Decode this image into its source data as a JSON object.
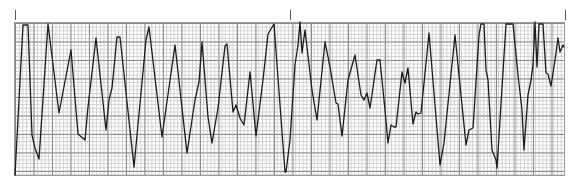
{
  "strip": {
    "grid": {
      "minor_color": "#cfcfcf",
      "major_color": "#8a8a8a",
      "background": "#ffffff",
      "minor_px": 3.7,
      "major_px": 18.5
    },
    "trace_color": "#1a1a1a",
    "markers": [
      {
        "x": 15
      },
      {
        "x": 290
      },
      {
        "x": 565
      }
    ]
  },
  "chart_data": {
    "type": "line",
    "title": "",
    "xlabel": "",
    "ylabel": "",
    "grid": true,
    "legend": "none",
    "note": "ECG rhythm strip on grid paper; coordinates are pixel positions (x right, y down)",
    "points": [
      [
        15,
        175
      ],
      [
        23,
        25
      ],
      [
        28,
        25
      ],
      [
        32,
        135
      ],
      [
        35,
        148
      ],
      [
        39,
        159
      ],
      [
        48,
        24
      ],
      [
        59,
        113
      ],
      [
        71,
        50
      ],
      [
        78,
        134
      ],
      [
        85,
        140
      ],
      [
        88,
        107
      ],
      [
        96,
        38
      ],
      [
        106,
        130
      ],
      [
        109,
        100
      ],
      [
        112,
        88
      ],
      [
        117,
        37
      ],
      [
        120,
        37
      ],
      [
        134,
        167
      ],
      [
        146,
        40
      ],
      [
        149,
        27
      ],
      [
        162,
        137
      ],
      [
        175,
        45
      ],
      [
        187,
        153
      ],
      [
        195,
        100
      ],
      [
        199,
        82
      ],
      [
        202,
        42
      ],
      [
        208,
        117
      ],
      [
        212,
        143
      ],
      [
        218,
        108
      ],
      [
        225,
        46
      ],
      [
        227,
        44
      ],
      [
        233,
        112
      ],
      [
        236,
        105
      ],
      [
        240,
        118
      ],
      [
        244,
        125
      ],
      [
        250,
        72
      ],
      [
        256,
        136
      ],
      [
        263,
        80
      ],
      [
        268,
        34
      ],
      [
        274,
        24
      ],
      [
        285,
        172
      ],
      [
        286,
        172
      ],
      [
        290,
        140
      ],
      [
        295,
        65
      ],
      [
        298,
        45
      ],
      [
        300,
        22
      ],
      [
        302,
        53
      ],
      [
        305,
        30
      ],
      [
        312,
        90
      ],
      [
        317,
        120
      ],
      [
        325,
        42
      ],
      [
        330,
        67
      ],
      [
        336,
        103
      ],
      [
        338,
        104
      ],
      [
        342,
        136
      ],
      [
        348,
        80
      ],
      [
        355,
        55
      ],
      [
        361,
        95
      ],
      [
        364,
        100
      ],
      [
        367,
        93
      ],
      [
        370,
        108
      ],
      [
        377,
        60
      ],
      [
        380,
        60
      ],
      [
        385,
        110
      ],
      [
        388,
        143
      ],
      [
        391,
        125
      ],
      [
        394,
        127
      ],
      [
        396,
        127
      ],
      [
        402,
        72
      ],
      [
        405,
        83
      ],
      [
        408,
        68
      ],
      [
        413,
        124
      ],
      [
        416,
        112
      ],
      [
        418,
        114
      ],
      [
        421,
        113
      ],
      [
        429,
        33
      ],
      [
        440,
        165
      ],
      [
        444,
        143
      ],
      [
        455,
        35
      ],
      [
        466,
        145
      ],
      [
        469,
        130
      ],
      [
        473,
        128
      ],
      [
        479,
        35
      ],
      [
        481,
        24
      ],
      [
        484,
        24
      ],
      [
        486,
        70
      ],
      [
        488,
        80
      ],
      [
        492,
        150
      ],
      [
        496,
        160
      ],
      [
        497,
        168
      ],
      [
        506,
        24
      ],
      [
        513,
        24
      ],
      [
        518,
        75
      ],
      [
        522,
        110
      ],
      [
        524,
        150
      ],
      [
        528,
        95
      ],
      [
        531,
        80
      ],
      [
        533,
        65
      ],
      [
        535,
        22
      ],
      [
        537,
        67
      ],
      [
        539,
        24
      ],
      [
        543,
        24
      ],
      [
        546,
        73
      ],
      [
        548,
        74
      ],
      [
        551,
        86
      ],
      [
        555,
        60
      ],
      [
        558,
        38
      ],
      [
        560,
        52
      ],
      [
        563,
        45
      ],
      [
        564,
        47
      ]
    ]
  }
}
